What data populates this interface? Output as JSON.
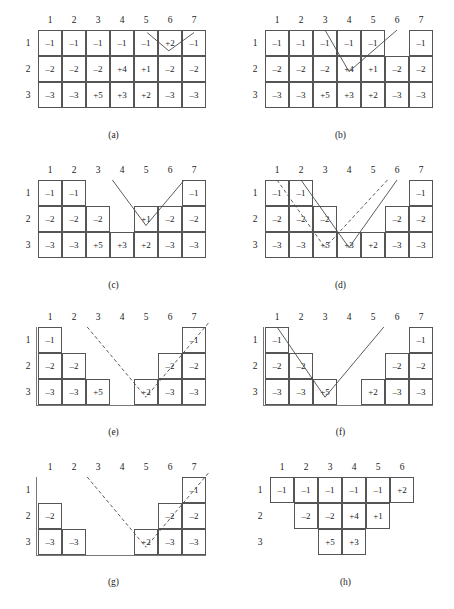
{
  "figure": {
    "col_labels": [
      "1",
      "2",
      "3",
      "4",
      "5",
      "6",
      "7"
    ],
    "row_labels": [
      "1",
      "2",
      "3"
    ],
    "colors": {
      "cell_border": "#555555",
      "line": "#4a4a4a",
      "text": "#1a1a1a"
    }
  },
  "panels": [
    {
      "id": "a",
      "caption": "(a)",
      "col_labels": [
        "1",
        "2",
        "3",
        "4",
        "5",
        "6",
        "7"
      ],
      "row_labels": [
        "1",
        "2",
        "3"
      ],
      "rows": [
        {
          "label": "1",
          "cells": [
            {
              "col": 1,
              "value": "–1"
            },
            {
              "col": 2,
              "value": "–1"
            },
            {
              "col": 3,
              "value": "–1"
            },
            {
              "col": 4,
              "value": "–1"
            },
            {
              "col": 5,
              "value": "–1"
            },
            {
              "col": 6,
              "value": "+2"
            },
            {
              "col": 7,
              "value": "–1"
            }
          ]
        },
        {
          "label": "2",
          "cells": [
            {
              "col": 1,
              "value": "–2"
            },
            {
              "col": 2,
              "value": "–2"
            },
            {
              "col": 3,
              "value": "–2"
            },
            {
              "col": 4,
              "value": "+4"
            },
            {
              "col": 5,
              "value": "+1"
            },
            {
              "col": 6,
              "value": "–2"
            },
            {
              "col": 7,
              "value": "–2"
            }
          ]
        },
        {
          "label": "3",
          "cells": [
            {
              "col": 1,
              "value": "–3"
            },
            {
              "col": 2,
              "value": "–3"
            },
            {
              "col": 3,
              "value": "+5"
            },
            {
              "col": 4,
              "value": "+3"
            },
            {
              "col": 5,
              "value": "+2"
            },
            {
              "col": 6,
              "value": "–3"
            },
            {
              "col": 7,
              "value": "–3"
            }
          ]
        }
      ],
      "paths": [
        {
          "style": "solid",
          "points": [
            [
              5.05,
              0.1
            ],
            [
              5.95,
              0.8
            ]
          ]
        },
        {
          "style": "solid",
          "points": [
            [
              7.0,
              0.1
            ],
            [
              5.95,
              0.8
            ]
          ]
        }
      ]
    },
    {
      "id": "b",
      "caption": "(b)",
      "col_labels": [
        "1",
        "2",
        "3",
        "4",
        "5",
        "6",
        "7"
      ],
      "row_labels": [
        "1",
        "2",
        "3"
      ],
      "rows": [
        {
          "label": "1",
          "cells": [
            {
              "col": 1,
              "value": "–1"
            },
            {
              "col": 2,
              "value": "–1"
            },
            {
              "col": 3,
              "value": "–1"
            },
            {
              "col": 4,
              "value": "–1"
            },
            {
              "col": 5,
              "value": "–1"
            },
            {
              "col": 7,
              "value": "–1"
            }
          ]
        },
        {
          "label": "2",
          "cells": [
            {
              "col": 1,
              "value": "–2"
            },
            {
              "col": 2,
              "value": "–2"
            },
            {
              "col": 3,
              "value": "–2"
            },
            {
              "col": 4,
              "value": "+4"
            },
            {
              "col": 5,
              "value": "+1"
            },
            {
              "col": 6,
              "value": "–2"
            },
            {
              "col": 7,
              "value": "–2"
            }
          ]
        },
        {
          "label": "3",
          "cells": [
            {
              "col": 1,
              "value": "–3"
            },
            {
              "col": 2,
              "value": "–3"
            },
            {
              "col": 3,
              "value": "+5"
            },
            {
              "col": 4,
              "value": "+3"
            },
            {
              "col": 5,
              "value": "+2"
            },
            {
              "col": 6,
              "value": "–3"
            },
            {
              "col": 7,
              "value": "–3"
            }
          ]
        }
      ],
      "paths": [
        {
          "style": "solid",
          "points": [
            [
              3.0,
              0.0
            ],
            [
              4.0,
              1.6
            ]
          ]
        },
        {
          "style": "solid",
          "points": [
            [
              6.0,
              0.0
            ],
            [
              4.0,
              1.6
            ]
          ]
        }
      ]
    },
    {
      "id": "c",
      "caption": "(c)",
      "col_labels": [
        "1",
        "2",
        "3",
        "4",
        "5",
        "6",
        "7"
      ],
      "row_labels": [
        "1",
        "2",
        "3"
      ],
      "rows": [
        {
          "label": "1",
          "cells": [
            {
              "col": 1,
              "value": "–1"
            },
            {
              "col": 2,
              "value": "–1"
            },
            {
              "col": 7,
              "value": "–1"
            }
          ]
        },
        {
          "label": "2",
          "cells": [
            {
              "col": 1,
              "value": "–2"
            },
            {
              "col": 2,
              "value": "–2"
            },
            {
              "col": 3,
              "value": "–2"
            },
            {
              "col": 5,
              "value": "+1"
            },
            {
              "col": 6,
              "value": "–2"
            },
            {
              "col": 7,
              "value": "–2"
            }
          ]
        },
        {
          "label": "3",
          "cells": [
            {
              "col": 1,
              "value": "–3"
            },
            {
              "col": 2,
              "value": "–3"
            },
            {
              "col": 3,
              "value": "+5"
            },
            {
              "col": 4,
              "value": "+3"
            },
            {
              "col": 5,
              "value": "+2"
            },
            {
              "col": 6,
              "value": "–3"
            },
            {
              "col": 7,
              "value": "–3"
            }
          ]
        }
      ],
      "paths": [
        {
          "style": "solid",
          "points": [
            [
              3.6,
              0.0
            ],
            [
              5.0,
              1.75
            ]
          ]
        },
        {
          "style": "solid",
          "points": [
            [
              6.55,
              0.05
            ],
            [
              5.0,
              1.75
            ]
          ]
        }
      ]
    },
    {
      "id": "d",
      "caption": "(d)",
      "col_labels": [
        "1",
        "2",
        "3",
        "4",
        "5",
        "6",
        "7"
      ],
      "row_labels": [
        "1",
        "2",
        "3"
      ],
      "rows": [
        {
          "label": "1",
          "cells": [
            {
              "col": 1,
              "value": "–1"
            },
            {
              "col": 2,
              "value": "–1"
            },
            {
              "col": 7,
              "value": "–1"
            }
          ]
        },
        {
          "label": "2",
          "cells": [
            {
              "col": 1,
              "value": "–2"
            },
            {
              "col": 2,
              "value": "–2"
            },
            {
              "col": 3,
              "value": "–2"
            },
            {
              "col": 6,
              "value": "–2"
            },
            {
              "col": 7,
              "value": "–2"
            }
          ]
        },
        {
          "label": "3",
          "cells": [
            {
              "col": 1,
              "value": "–3"
            },
            {
              "col": 2,
              "value": "–3"
            },
            {
              "col": 3,
              "value": "+5"
            },
            {
              "col": 4,
              "value": "+3"
            },
            {
              "col": 5,
              "value": "+2"
            },
            {
              "col": 6,
              "value": "–3"
            },
            {
              "col": 7,
              "value": "–3"
            }
          ]
        }
      ],
      "paths": [
        {
          "style": "solid",
          "points": [
            [
              2.0,
              0.0
            ],
            [
              4.0,
              2.6
            ]
          ]
        },
        {
          "style": "solid",
          "points": [
            [
              6.0,
              0.0
            ],
            [
              4.0,
              2.6
            ]
          ]
        },
        {
          "style": "dashed",
          "points": [
            [
              1.0,
              0.0
            ],
            [
              3.0,
              2.6
            ]
          ]
        },
        {
          "style": "dashed",
          "points": [
            [
              5.6,
              0.0
            ],
            [
              3.0,
              2.6
            ]
          ]
        }
      ]
    },
    {
      "id": "e",
      "caption": "(e)",
      "col_labels": [
        "1",
        "2",
        "3",
        "4",
        "5",
        "6",
        "7"
      ],
      "row_labels": [
        "1",
        "2",
        "3"
      ],
      "rows": [
        {
          "label": "1",
          "cells": [
            {
              "col": 1,
              "value": "–1"
            },
            {
              "col": 7,
              "value": "–1"
            }
          ]
        },
        {
          "label": "2",
          "cells": [
            {
              "col": 1,
              "value": "–2"
            },
            {
              "col": 2,
              "value": "–2"
            },
            {
              "col": 6,
              "value": "–2"
            },
            {
              "col": 7,
              "value": "–2"
            }
          ]
        },
        {
          "label": "3",
          "cells": [
            {
              "col": 1,
              "value": "–3"
            },
            {
              "col": 2,
              "value": "–3"
            },
            {
              "col": 3,
              "value": "+5"
            },
            {
              "col": 5,
              "value": "+2"
            },
            {
              "col": 6,
              "value": "–3"
            },
            {
              "col": 7,
              "value": "–3"
            }
          ]
        }
      ],
      "paths": [
        {
          "style": "dashed",
          "points": [
            [
              2.55,
              0.0
            ],
            [
              5.0,
              2.7
            ]
          ]
        },
        {
          "style": "dashed",
          "points": [
            [
              7.6,
              -0.15
            ],
            [
              5.0,
              2.7
            ]
          ]
        }
      ]
    },
    {
      "id": "f",
      "caption": "(f)",
      "col_labels": [
        "1",
        "2",
        "3",
        "4",
        "5",
        "6",
        "7"
      ],
      "row_labels": [
        "1",
        "2",
        "3"
      ],
      "rows": [
        {
          "label": "1",
          "cells": [
            {
              "col": 1,
              "value": "–1"
            },
            {
              "col": 7,
              "value": "–1"
            }
          ]
        },
        {
          "label": "2",
          "cells": [
            {
              "col": 1,
              "value": "–2"
            },
            {
              "col": 2,
              "value": "–2"
            },
            {
              "col": 6,
              "value": "–2"
            },
            {
              "col": 7,
              "value": "–2"
            }
          ]
        },
        {
          "label": "3",
          "cells": [
            {
              "col": 1,
              "value": "–3"
            },
            {
              "col": 2,
              "value": "–3"
            },
            {
              "col": 3,
              "value": "+5"
            },
            {
              "col": 5,
              "value": "+2"
            },
            {
              "col": 6,
              "value": "–3"
            },
            {
              "col": 7,
              "value": "–3"
            }
          ]
        }
      ],
      "paths": [
        {
          "style": "solid",
          "points": [
            [
              1.0,
              0.0
            ],
            [
              3.0,
              2.7
            ]
          ]
        },
        {
          "style": "solid",
          "points": [
            [
              5.45,
              0.0
            ],
            [
              3.0,
              2.7
            ]
          ]
        }
      ]
    },
    {
      "id": "g",
      "caption": "(g)",
      "col_labels": [
        "1",
        "2",
        "3",
        "4",
        "5",
        "6",
        "7"
      ],
      "row_labels": [
        "1",
        "2",
        "3"
      ],
      "rows": [
        {
          "label": "1",
          "cells": [
            {
              "col": 7,
              "value": "–1"
            }
          ]
        },
        {
          "label": "2",
          "cells": [
            {
              "col": 1,
              "value": "–2"
            },
            {
              "col": 6,
              "value": "–2"
            },
            {
              "col": 7,
              "value": "–2"
            }
          ]
        },
        {
          "label": "3",
          "cells": [
            {
              "col": 1,
              "value": "–3"
            },
            {
              "col": 2,
              "value": "–3"
            },
            {
              "col": 5,
              "value": "+2"
            },
            {
              "col": 6,
              "value": "–3"
            },
            {
              "col": 7,
              "value": "–3"
            }
          ]
        }
      ],
      "paths": [
        {
          "style": "dashed",
          "points": [
            [
              2.55,
              0.0
            ],
            [
              5.0,
              2.7
            ]
          ]
        },
        {
          "style": "dashed",
          "points": [
            [
              7.6,
              -0.15
            ],
            [
              5.0,
              2.7
            ]
          ]
        }
      ]
    },
    {
      "id": "h",
      "caption": "(h)",
      "col_labels": [
        "1",
        "2",
        "3",
        "4",
        "5",
        "6"
      ],
      "row_labels": [
        "1",
        "2",
        "3"
      ],
      "rows": [
        {
          "label": "1",
          "cells": [
            {
              "col": 1,
              "value": "–1"
            },
            {
              "col": 2,
              "value": "–1"
            },
            {
              "col": 3,
              "value": "–1"
            },
            {
              "col": 4,
              "value": "–1"
            },
            {
              "col": 5,
              "value": "–1"
            },
            {
              "col": 6,
              "value": "+2"
            }
          ]
        },
        {
          "label": "2",
          "cells": [
            {
              "col": 2,
              "value": "–2"
            },
            {
              "col": 3,
              "value": "–2"
            },
            {
              "col": 4,
              "value": "+4"
            },
            {
              "col": 5,
              "value": "+1"
            }
          ]
        },
        {
          "label": "3",
          "cells": [
            {
              "col": 3,
              "value": "+5"
            },
            {
              "col": 4,
              "value": "+3"
            }
          ]
        }
      ],
      "paths": []
    }
  ]
}
